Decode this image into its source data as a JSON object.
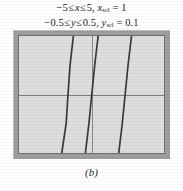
{
  "figure": {
    "part_label": "(b)",
    "settings": {
      "x_line": {
        "min": "−5",
        "rel1": "≤",
        "var": "x",
        "rel2": "≤",
        "max": "5",
        "comma": ",",
        "scale_var": "x",
        "scale_sub": "scl",
        "equals": "=",
        "scale_value": "1"
      },
      "y_line": {
        "min": "−0.5",
        "rel1": "≤",
        "var": "y",
        "rel2": "≤",
        "max": "0.5",
        "comma": ",",
        "scale_var": "y",
        "scale_sub": "scl",
        "equals": "=",
        "scale_value": "0.1"
      }
    },
    "colors": {
      "screen_background": "#dedddb",
      "frame_bevel": "#9e9e9e",
      "frame_rule": "#6f6f6f",
      "axis": "#7d7d7d",
      "curve": "#3a3a3a",
      "page_background": "#ffffff"
    }
  },
  "chart_data": {
    "type": "line",
    "title": "",
    "subtitle": "",
    "xlabel": "",
    "ylabel": "",
    "xlim": [
      -5,
      5
    ],
    "ylim": [
      -0.5,
      0.5
    ],
    "x_scl": 1,
    "y_scl": 0.1,
    "grid": false,
    "legend_position": "none",
    "axes": {
      "x_axis_at_y": 0,
      "y_axis_at_x": 0,
      "x_axis_visible": true,
      "y_axis_visible": true,
      "ticks_visible": false
    },
    "annotations": [
      "-5 ≤ x ≤ 5, xscl = 1",
      "-0.5 ≤ y ≤ 0.5, yscl = 0.1"
    ],
    "series": [
      {
        "name": "branch-left",
        "points": [
          {
            "x": -2.05,
            "y": -0.5
          },
          {
            "x": -1.75,
            "y": -0.25
          },
          {
            "x": -1.62,
            "y": 0.0
          },
          {
            "x": -1.48,
            "y": 0.25
          },
          {
            "x": -1.25,
            "y": 0.5
          }
        ]
      },
      {
        "name": "branch-middle",
        "points": [
          {
            "x": -0.42,
            "y": -0.5
          },
          {
            "x": -0.18,
            "y": -0.25
          },
          {
            "x": 0.02,
            "y": 0.0
          },
          {
            "x": 0.22,
            "y": 0.25
          },
          {
            "x": 0.46,
            "y": 0.5
          }
        ]
      },
      {
        "name": "branch-right",
        "points": [
          {
            "x": 1.88,
            "y": -0.5
          },
          {
            "x": 2.12,
            "y": -0.25
          },
          {
            "x": 2.32,
            "y": 0.0
          },
          {
            "x": 2.52,
            "y": 0.25
          },
          {
            "x": 2.76,
            "y": 0.5
          }
        ]
      }
    ]
  }
}
